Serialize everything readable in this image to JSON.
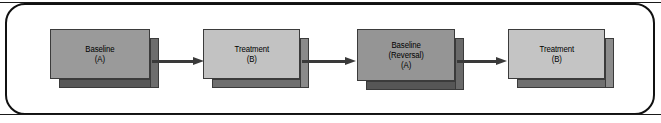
{
  "figure": {
    "frame": {
      "shape": "rounded-rectangle",
      "border_color": "#111111"
    },
    "background_color": "#ffffff",
    "arrow_color": "#3a3a3a",
    "nodes": [
      {
        "id": "baseline-a",
        "lines": [
          "Baseline",
          "(A)"
        ],
        "fill": "#9a9a9a",
        "side_fill": "#6d6d6d",
        "bottom_fill": "#585858",
        "x": 50,
        "width": 100,
        "height": 50
      },
      {
        "id": "treatment-b-1",
        "lines": [
          "Treatment",
          "(B)"
        ],
        "fill": "#c2c2c2",
        "side_fill": "#8a8a8a",
        "bottom_fill": "#6f6f6f",
        "x": 203,
        "width": 97,
        "height": 50
      },
      {
        "id": "baseline-reversal-a",
        "lines": [
          "Baseline",
          "(Reversal)",
          "(A)"
        ],
        "fill": "#959595",
        "side_fill": "#6a6a6a",
        "bottom_fill": "#565656",
        "x": 357,
        "width": 98,
        "height": 52
      },
      {
        "id": "treatment-b-2",
        "lines": [
          "Treatment",
          "(B)"
        ],
        "fill": "#c4c4c4",
        "side_fill": "#8c8c8c",
        "bottom_fill": "#707070",
        "x": 508,
        "width": 97,
        "height": 50
      }
    ],
    "arrows": [
      {
        "id": "arrow-1",
        "from": "baseline-a",
        "to": "treatment-b-1",
        "x": 152,
        "width": 52
      },
      {
        "id": "arrow-2",
        "from": "treatment-b-1",
        "to": "baseline-reversal-a",
        "x": 302,
        "width": 54
      },
      {
        "id": "arrow-3",
        "from": "baseline-reversal-a",
        "to": "treatment-b-2",
        "x": 457,
        "width": 50
      }
    ]
  }
}
